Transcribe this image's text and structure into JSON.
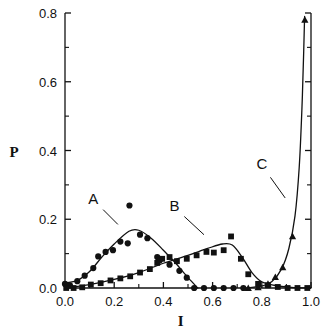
{
  "chart_data": {
    "type": "scatter",
    "title": "",
    "subtitle": "",
    "xlabel": "I",
    "ylabel": "P",
    "xlim": [
      0.0,
      1.0
    ],
    "ylim": [
      0.0,
      0.8
    ],
    "grid": false,
    "legend_position": "inline-annotations",
    "x_ticks": [
      "0.0",
      "0.2",
      "0.4",
      "0.6",
      "0.8",
      "1.0"
    ],
    "x_tick_values": [
      0.0,
      0.2,
      0.4,
      0.6,
      0.8,
      1.0
    ],
    "x_minor_tick_step": 0.05,
    "y_ticks": [
      "0.0",
      "0.2",
      "0.4",
      "0.6",
      "0.8"
    ],
    "y_tick_values": [
      0.0,
      0.2,
      0.4,
      0.6,
      0.8
    ],
    "y_minor_tick_step": 0.1,
    "annotations": [
      {
        "text": "A",
        "x": 0.115,
        "y": 0.245
      },
      {
        "text": "B",
        "x": 0.445,
        "y": 0.225
      },
      {
        "text": "C",
        "x": 0.8,
        "y": 0.345
      }
    ],
    "series": [
      {
        "name": "A",
        "marker": "circle",
        "points": [
          {
            "x": 0.0,
            "y": 0.012
          },
          {
            "x": 0.02,
            "y": 0.008
          },
          {
            "x": 0.05,
            "y": 0.02
          },
          {
            "x": 0.08,
            "y": 0.036
          },
          {
            "x": 0.115,
            "y": 0.058
          },
          {
            "x": 0.135,
            "y": 0.092
          },
          {
            "x": 0.165,
            "y": 0.105
          },
          {
            "x": 0.195,
            "y": 0.11
          },
          {
            "x": 0.225,
            "y": 0.135
          },
          {
            "x": 0.255,
            "y": 0.13
          },
          {
            "x": 0.262,
            "y": 0.24
          },
          {
            "x": 0.305,
            "y": 0.155
          },
          {
            "x": 0.335,
            "y": 0.145
          },
          {
            "x": 0.375,
            "y": 0.09
          },
          {
            "x": 0.385,
            "y": 0.08
          },
          {
            "x": 0.425,
            "y": 0.068
          },
          {
            "x": 0.465,
            "y": 0.05
          },
          {
            "x": 0.495,
            "y": 0.03
          },
          {
            "x": 0.525,
            "y": 0.0
          },
          {
            "x": 0.565,
            "y": 0.0
          },
          {
            "x": 0.605,
            "y": 0.0
          },
          {
            "x": 0.645,
            "y": 0.0
          },
          {
            "x": 0.685,
            "y": 0.0
          },
          {
            "x": 0.725,
            "y": 0.0
          }
        ],
        "curve": [
          {
            "x": 0.0,
            "y": 0.015
          },
          {
            "x": 0.05,
            "y": 0.022
          },
          {
            "x": 0.1,
            "y": 0.048
          },
          {
            "x": 0.15,
            "y": 0.09
          },
          {
            "x": 0.2,
            "y": 0.128
          },
          {
            "x": 0.26,
            "y": 0.165
          },
          {
            "x": 0.3,
            "y": 0.168
          },
          {
            "x": 0.35,
            "y": 0.145
          },
          {
            "x": 0.4,
            "y": 0.11
          },
          {
            "x": 0.45,
            "y": 0.072
          },
          {
            "x": 0.5,
            "y": 0.03
          },
          {
            "x": 0.54,
            "y": 0.0
          }
        ]
      },
      {
        "name": "B",
        "marker": "square",
        "points": [
          {
            "x": 0.005,
            "y": 0.0
          },
          {
            "x": 0.035,
            "y": 0.0
          },
          {
            "x": 0.07,
            "y": 0.002
          },
          {
            "x": 0.105,
            "y": 0.01
          },
          {
            "x": 0.145,
            "y": 0.014
          },
          {
            "x": 0.185,
            "y": 0.022
          },
          {
            "x": 0.225,
            "y": 0.028
          },
          {
            "x": 0.265,
            "y": 0.034
          },
          {
            "x": 0.305,
            "y": 0.045
          },
          {
            "x": 0.345,
            "y": 0.055
          },
          {
            "x": 0.375,
            "y": 0.073
          },
          {
            "x": 0.395,
            "y": 0.085
          },
          {
            "x": 0.425,
            "y": 0.09
          },
          {
            "x": 0.455,
            "y": 0.078
          },
          {
            "x": 0.495,
            "y": 0.085
          },
          {
            "x": 0.535,
            "y": 0.095
          },
          {
            "x": 0.575,
            "y": 0.105
          },
          {
            "x": 0.605,
            "y": 0.103
          },
          {
            "x": 0.645,
            "y": 0.11
          },
          {
            "x": 0.675,
            "y": 0.15
          },
          {
            "x": 0.715,
            "y": 0.085
          },
          {
            "x": 0.745,
            "y": 0.04
          },
          {
            "x": 0.785,
            "y": 0.012
          },
          {
            "x": 0.825,
            "y": 0.008
          },
          {
            "x": 0.865,
            "y": 0.003
          },
          {
            "x": 0.905,
            "y": 0.0
          },
          {
            "x": 0.945,
            "y": 0.0
          },
          {
            "x": 0.985,
            "y": 0.0
          }
        ],
        "curve": [
          {
            "x": 0.0,
            "y": 0.0
          },
          {
            "x": 0.1,
            "y": 0.01
          },
          {
            "x": 0.2,
            "y": 0.025
          },
          {
            "x": 0.3,
            "y": 0.045
          },
          {
            "x": 0.4,
            "y": 0.072
          },
          {
            "x": 0.5,
            "y": 0.095
          },
          {
            "x": 0.58,
            "y": 0.115
          },
          {
            "x": 0.64,
            "y": 0.128
          },
          {
            "x": 0.68,
            "y": 0.125
          },
          {
            "x": 0.72,
            "y": 0.09
          },
          {
            "x": 0.76,
            "y": 0.045
          },
          {
            "x": 0.8,
            "y": 0.018
          },
          {
            "x": 0.85,
            "y": 0.008
          },
          {
            "x": 0.92,
            "y": 0.002
          },
          {
            "x": 1.0,
            "y": 0.0
          }
        ]
      },
      {
        "name": "C",
        "marker": "triangle",
        "points": [
          {
            "x": 0.745,
            "y": 0.0
          },
          {
            "x": 0.785,
            "y": 0.002
          },
          {
            "x": 0.825,
            "y": 0.012
          },
          {
            "x": 0.855,
            "y": 0.032
          },
          {
            "x": 0.885,
            "y": 0.06
          },
          {
            "x": 0.925,
            "y": 0.15
          },
          {
            "x": 0.975,
            "y": 0.78
          }
        ],
        "curve": [
          {
            "x": 0.74,
            "y": 0.0
          },
          {
            "x": 0.8,
            "y": 0.006
          },
          {
            "x": 0.84,
            "y": 0.018
          },
          {
            "x": 0.88,
            "y": 0.055
          },
          {
            "x": 0.91,
            "y": 0.115
          },
          {
            "x": 0.935,
            "y": 0.21
          },
          {
            "x": 0.952,
            "y": 0.35
          },
          {
            "x": 0.963,
            "y": 0.52
          },
          {
            "x": 0.97,
            "y": 0.68
          },
          {
            "x": 0.974,
            "y": 0.79
          }
        ]
      }
    ]
  }
}
